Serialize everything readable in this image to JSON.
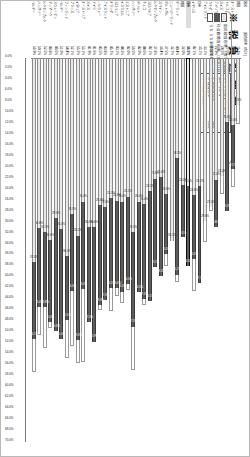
{
  "chart_data": {
    "type": "bar",
    "orientation": "horizontal",
    "title": "※ 税 負 担 額 順",
    "subtitle": "",
    "xlabel": "",
    "ylabel": "",
    "xlim": [
      0,
      70
    ],
    "grid": false,
    "legend_position": "top-left",
    "stacked": true,
    "value_suffix": "%",
    "column_headers": {
      "name": "国名",
      "total": "[税負担率（合計）]"
    },
    "series": [
      {
        "name": "国税負担率分",
        "note": "（数字は国税負担額に対する税負担率）",
        "color": "#e9e9e9"
      },
      {
        "name": "社会保障負担率分",
        "note": "（数字は社会保障負担額に対する税負担率）",
        "color": "#5d5d5d"
      },
      {
        "name": "うち うち消費税等税相当（税込）",
        "color": "#ffffff"
      }
    ],
    "categories": [
      "韓国",
      "オーストラリア",
      "トルコ",
      "スイス",
      "日本",
      "アメリカ",
      "カナダ",
      "アイルランド",
      "イギリス",
      "ニュージーランド",
      "ポルトガル",
      "スペイン",
      "ギリシャ",
      "ポーランド",
      "ルクセンブルク",
      "チェコ",
      "スロバキア",
      "ハンガリー",
      "エストニア",
      "スロベニア",
      "オランダ",
      "イスラエル",
      "アイスランド",
      "ノルウェー",
      "ドイツ",
      "スウェーデン",
      "オーストリア",
      "イタリア",
      "フィンランド",
      "フランス",
      "ベルギー",
      "デンマーク"
    ],
    "rows": [
      {
        "country": "韓国",
        "total": "11.7%",
        "tax": "8.3%",
        "social": "",
        "highlight": false
      },
      {
        "country": "オーストラリア",
        "total": "23.1%",
        "tax": "12.0%",
        "social": "8.1%",
        "highlight": false
      },
      {
        "country": "トルコ",
        "total": "27.6%",
        "tax": "11.4%",
        "social": "16.3%",
        "highlight": false
      },
      {
        "country": "スイス",
        "total": "24.5%",
        "tax": "21.4%",
        "social": "",
        "highlight": false
      },
      {
        "country": "アメリカ",
        "total": "22.9%",
        "tax": "22.0%",
        "social": "8.6%",
        "highlight": false
      },
      {
        "country": "カナダ",
        "total": "27.6%",
        "tax": "27.0%",
        "social": "",
        "highlight": false
      },
      {
        "country": "アイルランド",
        "total": "33.1%",
        "tax": "29.6%",
        "social": "",
        "highlight": false
      },
      {
        "country": "日本",
        "total": "35.1%",
        "tax": "23.2%",
        "social": "17.7%",
        "highlight": false
      },
      {
        "country": "イギリス",
        "total": "42.1%",
        "tax": "24.8%",
        "social": "11.6%",
        "highlight": false
      },
      {
        "country": "日本",
        "total": "36.5%",
        "tax": "23.2%",
        "social": "14.6%",
        "highlight": true
      },
      {
        "country": "韓国",
        "total": "32.0%",
        "tax": "23.0%",
        "social": "9.5%",
        "highlight": false
      },
      {
        "country": "ポーランド",
        "total": "40.4%",
        "tax": "18.1%",
        "social": "21.2%",
        "highlight": false
      },
      {
        "country": "ニュージーランド",
        "total": "32.7%",
        "tax": "33.1%",
        "social": "",
        "highlight": false
      },
      {
        "country": "ポルトガル",
        "total": "37.5%",
        "tax": "24.6%",
        "social": "11.0%",
        "highlight": false
      },
      {
        "country": "スペイン",
        "total": "36.4%",
        "tax": "21.6%",
        "social": "18.0%",
        "highlight": false
      },
      {
        "country": "ルクセンブルク",
        "total": "37.8%",
        "tax": "21.8%",
        "social": "16.1%",
        "highlight": false
      },
      {
        "country": "スロバキア",
        "total": "42.1%",
        "tax": "24.1%",
        "social": "20.1%",
        "highlight": false
      },
      {
        "country": "チェコ",
        "total": "44.6%",
        "tax": "26.4%",
        "social": "17.4%",
        "highlight": false
      },
      {
        "country": "ギリシャ",
        "total": "42.0%",
        "tax": "26.0%",
        "social": "16.5%",
        "highlight": false
      },
      {
        "country": "ハンガリー",
        "total": "56.5%",
        "tax": "31.5%",
        "social": "17.3%",
        "highlight": false
      },
      {
        "country": "エストニア",
        "total": "42.0%",
        "tax": "25.1%",
        "social": "16.0%",
        "highlight": false
      },
      {
        "country": "イスラエル",
        "total": "44.3%",
        "tax": "26.0%",
        "social": "16.4%",
        "highlight": false
      },
      {
        "country": "スロベニア",
        "total": "43.1%",
        "tax": "25.8%",
        "social": "16.0%",
        "highlight": false
      },
      {
        "country": "オランダ",
        "total": "45.7%",
        "tax": "25.3%",
        "social": "16.5%",
        "highlight": false
      },
      {
        "country": "アイスランド",
        "total": "43.8%",
        "tax": "27.0%",
        "social": "17.0%",
        "highlight": false
      },
      {
        "country": "ノルウェー",
        "total": "45.5%",
        "tax": "26.6%",
        "social": "18.3%",
        "highlight": false
      },
      {
        "country": "ドイツ",
        "total": "41.6%",
        "tax": "30.6%",
        "social": "20.9%",
        "highlight": false
      },
      {
        "country": "スイス",
        "total": "41.9%",
        "tax": "30.6%",
        "social": "17.3%",
        "highlight": false
      },
      {
        "country": "オーストリア",
        "total": "55.1%",
        "tax": "26.0%",
        "social": "16.0%",
        "highlight": false
      },
      {
        "country": "イタリア",
        "total": "55.2%",
        "tax": "32.2%",
        "social": "19.0%",
        "highlight": false
      },
      {
        "country": "フランス",
        "total": "52.1%",
        "tax": "28.3%",
        "social": "14.0%",
        "highlight": false
      },
      {
        "country": "フィンランド",
        "total": "54.4%",
        "tax": "36.0%",
        "social": "11.5%",
        "highlight": false
      },
      {
        "country": "ベルギー",
        "total": "51.0%",
        "tax": "31.0%",
        "social": "20.0%",
        "highlight": false
      },
      {
        "country": "スウェーデン",
        "total": "46.6%",
        "tax": "29.0%",
        "social": "20.6%",
        "highlight": false
      },
      {
        "country": "デンマーク",
        "total": "48.8%",
        "tax": "33.0%",
        "social": "15.0%",
        "highlight": false
      },
      {
        "country": "ルクセンブルク",
        "total": "52.5%",
        "tax": "31.5%",
        "social": "13.8%",
        "highlight": false
      },
      {
        "country": "ハンガリー",
        "total": "50.1%",
        "tax": "30.8%",
        "social": "14.4%",
        "highlight": false
      },
      {
        "country": "ベルギー",
        "total": "56.9%",
        "tax": "37.0%",
        "social": "14.1%",
        "highlight": false
      }
    ],
    "xticks": [
      "0.0%",
      "2.0%",
      "4.0%",
      "6.0%",
      "8.0%",
      "10.0%",
      "12.0%",
      "14.0%",
      "16.0%",
      "18.0%",
      "20.0%",
      "22.0%",
      "24.0%",
      "26.0%",
      "28.0%",
      "30.0%",
      "32.0%",
      "34.0%",
      "36.0%",
      "38.0%",
      "40.0%",
      "42.0%",
      "44.0%",
      "46.0%",
      "48.0%",
      "50.0%",
      "52.0%",
      "54.0%",
      "56.0%",
      "58.0%",
      "60.0%",
      "62.0%",
      "64.0%",
      "66.0%",
      "68.0%",
      "70.0%"
    ]
  },
  "legend": {
    "items": [
      {
        "label": "国民税負担率",
        "note": "（数字は国税負担額に対する税負担率）",
        "swatch": "light"
      },
      {
        "label": "社会保障負担率",
        "note": "（数字は社会保障負担額に対する税負担率）",
        "swatch": "dark"
      },
      {
        "label": "うち うち消費税等相当（税込）",
        "note": "",
        "swatch": "none"
      }
    ]
  },
  "notebox": {
    "header": "日本の位置 [33か国中]",
    "sub": "高い方から",
    "lines": [
      {
        "key": "① 国民負担率",
        "value": "34位"
      },
      {
        "key": "② 税負担率",
        "value": "28位"
      },
      {
        "key": "③ 社会保障負担率",
        "value": "24位"
      }
    ]
  }
}
